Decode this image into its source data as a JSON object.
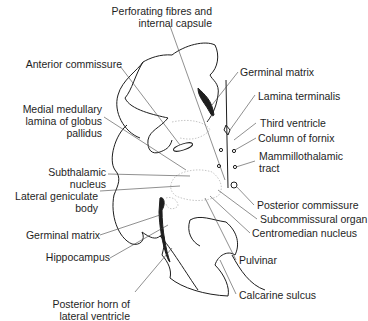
{
  "figure": {
    "type": "anatomical-section-diagram",
    "labels_left": [
      {
        "id": "perforating",
        "lines": [
          "Perforating fibres and",
          "internal capsule"
        ]
      },
      {
        "id": "anterior-commissure",
        "lines": [
          "Anterior commissure"
        ]
      },
      {
        "id": "medial-medullary",
        "lines": [
          "Medial medullary",
          "lamina of globus",
          "pallidus"
        ]
      },
      {
        "id": "subthalamic",
        "lines": [
          "Subthalamic",
          "nucleus"
        ]
      },
      {
        "id": "lateral-geniculate",
        "lines": [
          "Lateral geniculate",
          "body"
        ]
      },
      {
        "id": "germinal-matrix-left",
        "lines": [
          "Germinal matrix"
        ]
      },
      {
        "id": "hippocampus",
        "lines": [
          "Hippocampus"
        ]
      },
      {
        "id": "posterior-horn",
        "lines": [
          "Posterior horn of",
          "lateral ventricle"
        ]
      }
    ],
    "labels_right": [
      {
        "id": "germinal-matrix-right",
        "lines": [
          "Germinal matrix"
        ]
      },
      {
        "id": "lamina-terminalis",
        "lines": [
          "Lamina terminalis"
        ]
      },
      {
        "id": "third-ventricle",
        "lines": [
          "Third ventricle"
        ]
      },
      {
        "id": "column-of-fornix",
        "lines": [
          "Column of fornix"
        ]
      },
      {
        "id": "mammillothalamic",
        "lines": [
          "Mammillothalamic",
          "tract"
        ]
      },
      {
        "id": "posterior-commissure",
        "lines": [
          "Posterior commissure"
        ]
      },
      {
        "id": "subcommissural",
        "lines": [
          "Subcommissural organ"
        ]
      },
      {
        "id": "centromedian",
        "lines": [
          "Centromedian nucleus"
        ]
      },
      {
        "id": "pulvinar",
        "lines": [
          "Pulvinar"
        ]
      },
      {
        "id": "calcarine",
        "lines": [
          "Calcarine sulcus"
        ]
      }
    ],
    "colors": {
      "line": "#1e1e1e",
      "stipple": "#b8b8b8",
      "background": "#ffffff"
    }
  }
}
